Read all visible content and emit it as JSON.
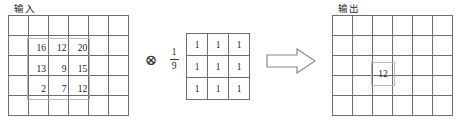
{
  "diagram": {
    "title_input": "输入",
    "title_output": "输出",
    "operator": "⊗",
    "arrow": "arrow-right-outline",
    "scalar": {
      "numerator": "1",
      "denominator": "9"
    },
    "input_grid": {
      "cols": 6,
      "rows": 5,
      "patch_values": [
        [
          "16",
          "12",
          "20"
        ],
        [
          "13",
          "9",
          "15"
        ],
        [
          "2",
          "7",
          "12"
        ]
      ]
    },
    "kernel_grid": {
      "cols": 3,
      "rows": 3,
      "values": [
        [
          "1",
          "1",
          "1"
        ],
        [
          "1",
          "1",
          "1"
        ],
        [
          "1",
          "1",
          "1"
        ]
      ]
    },
    "output_grid": {
      "cols": 6,
      "rows": 5,
      "highlight_value": "12"
    },
    "colors": {
      "grid_line": "#6e6e6e",
      "highlight": "#b9b9b9",
      "text": "#1a1a1a",
      "background": "#ffffff"
    }
  }
}
